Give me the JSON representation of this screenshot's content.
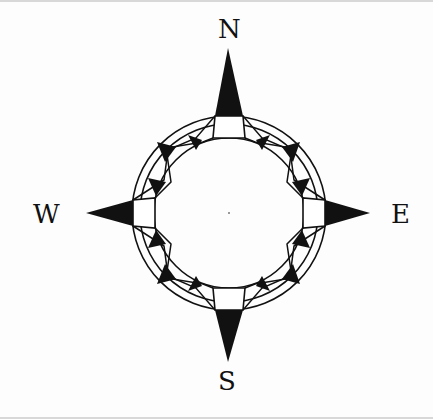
{
  "diagram": {
    "type": "compass-rose",
    "colors": {
      "ink": "#111111",
      "background": "#fdfdfd"
    },
    "center": [
      229,
      213
    ],
    "rings": {
      "outer_radius": 97,
      "middle_radius": 89,
      "inner_radius": 75
    },
    "labels": {
      "north": "N",
      "east": "E",
      "south": "S",
      "west": "W"
    }
  }
}
